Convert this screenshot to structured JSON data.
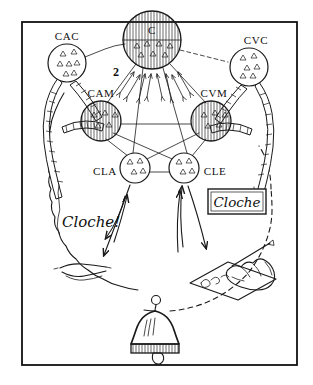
{
  "figure": {
    "caption": "",
    "background_color": "#ffffff",
    "ink_color": "#1a1a1a",
    "frame": {
      "name": "outer-frame",
      "x": 22,
      "y": 22,
      "width": 275,
      "height": 343
    }
  },
  "centers": [
    {
      "id": "C",
      "label": "C",
      "full_name": "centre-ideational",
      "x": 152,
      "y": 40,
      "r": 29,
      "hatched": true,
      "position": "top-center"
    },
    {
      "id": "CAC",
      "label": "CAC",
      "full_name": "centre-auditif-commun",
      "x": 67,
      "y": 63,
      "r": 19,
      "hatched": false,
      "position": "upper-left"
    },
    {
      "id": "CVC",
      "label": "CVC",
      "full_name": "centre-visuel-commun",
      "x": 249,
      "y": 67,
      "r": 19,
      "hatched": false,
      "position": "upper-right"
    },
    {
      "id": "CAM",
      "label": "CAM",
      "full_name": "centre-auditif-des-mots",
      "x": 101,
      "y": 121,
      "r": 20,
      "hatched": true,
      "position": "mid-left"
    },
    {
      "id": "CVM",
      "label": "CVM",
      "full_name": "centre-visuel-des-mots",
      "x": 211,
      "y": 121,
      "r": 20,
      "hatched": true,
      "position": "mid-right"
    },
    {
      "id": "CLA",
      "label": "CLA",
      "full_name": "centre-du-langage-articule",
      "x": 135,
      "y": 168,
      "r": 15,
      "hatched": false,
      "position": "lower-left"
    },
    {
      "id": "CLE",
      "label": "CLE",
      "full_name": "centre-du-langage-ecrit",
      "x": 184,
      "y": 168,
      "r": 15,
      "hatched": false,
      "position": "lower-right"
    }
  ],
  "annotations": [
    {
      "id": "num2",
      "text": "2",
      "x": 116,
      "y": 72,
      "kind": "pathway-number"
    }
  ],
  "speech": {
    "id": "spoken-word",
    "text": "Cloche!",
    "x": 62,
    "y": 227,
    "kind": "handwritten-exclamation"
  },
  "written": {
    "id": "written-word",
    "text": "Cloche",
    "box": {
      "x": 208,
      "y": 189,
      "width": 58,
      "height": 25
    },
    "kind": "boxed-printed-word"
  },
  "objects": [
    {
      "id": "bell",
      "name": "bell-illustration",
      "x": 156,
      "y": 320,
      "label": ""
    },
    {
      "id": "mouth",
      "name": "mouth-illustration",
      "x": 82,
      "y": 268,
      "label": ""
    },
    {
      "id": "hand",
      "name": "writing-hand-illustration",
      "x": 245,
      "y": 272,
      "label": ""
    }
  ],
  "connections": [
    {
      "from": "C",
      "to": "CAM",
      "style": "solid"
    },
    {
      "from": "C",
      "to": "CVM",
      "style": "solid"
    },
    {
      "from": "C",
      "to": "CLA",
      "style": "solid"
    },
    {
      "from": "C",
      "to": "CLE",
      "style": "solid"
    },
    {
      "from": "CAM",
      "to": "CVM",
      "style": "solid"
    },
    {
      "from": "CAM",
      "to": "CLA",
      "style": "solid"
    },
    {
      "from": "CAM",
      "to": "CLE",
      "style": "solid"
    },
    {
      "from": "CVM",
      "to": "CLA",
      "style": "solid"
    },
    {
      "from": "CVM",
      "to": "CLE",
      "style": "solid"
    },
    {
      "from": "CLA",
      "to": "CLE",
      "style": "solid"
    },
    {
      "from": "CAC",
      "to": "C",
      "style": "wavy"
    },
    {
      "from": "C",
      "to": "CVC",
      "style": "dashed"
    }
  ]
}
